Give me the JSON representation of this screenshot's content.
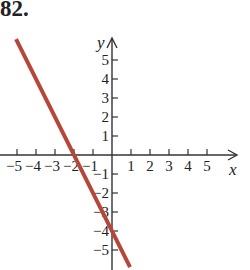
{
  "problem_number": "82.",
  "colors": {
    "axis": "#333333",
    "line": "#b5473a",
    "text": "#222222"
  },
  "chart_data": {
    "type": "line",
    "title": "82.",
    "xlabel": "x",
    "ylabel": "y",
    "xlim": [
      -5.5,
      6
    ],
    "ylim": [
      -6,
      6
    ],
    "grid": false,
    "x_ticks": [
      -5,
      -4,
      -3,
      -2,
      -1,
      1,
      2,
      3,
      4,
      5
    ],
    "y_ticks": [
      -5,
      -4,
      -3,
      -2,
      -1,
      1,
      2,
      3,
      4,
      5
    ],
    "x_tick_labels": [
      "−5",
      "−4",
      "−3",
      "−2",
      "−1",
      "1",
      "2",
      "3",
      "4",
      "5"
    ],
    "y_tick_labels": [
      "−5",
      "−4",
      "−3",
      "−2",
      "−1",
      "1",
      "2",
      "3",
      "4",
      "5"
    ],
    "series": [
      {
        "name": "y = -2x - 4",
        "equation": "y = -2x - 4",
        "slope": -2,
        "intercept": -4,
        "x": [
          -5,
          -4,
          -3,
          -2,
          -1,
          0,
          0.5
        ],
        "y": [
          6,
          4,
          2,
          0,
          -2,
          -4,
          -5
        ]
      }
    ],
    "annotations": {
      "x_intercept": -2,
      "y_intercept": -4
    }
  }
}
